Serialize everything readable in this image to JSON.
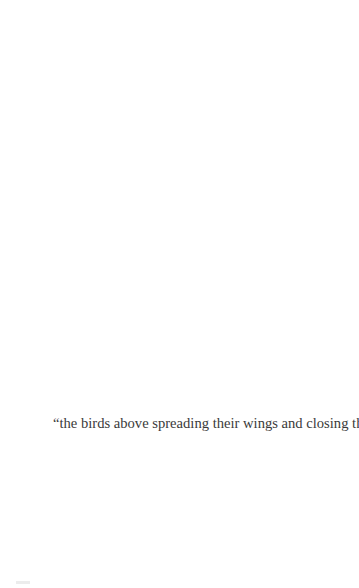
{
  "page": {
    "quote_text": "“the birds above spreading their wings and closing them?”"
  }
}
